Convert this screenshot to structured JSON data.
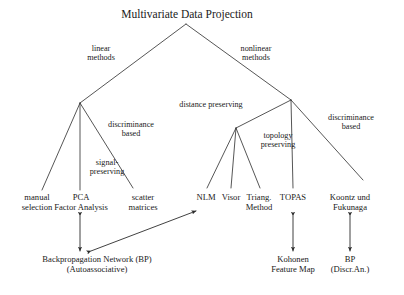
{
  "diagram": {
    "title": "Multivariate Data Projection",
    "title_x": 187,
    "branch_labels": [
      {
        "text": "linear\nmethods",
        "x": 101,
        "y": 44
      },
      {
        "text": "nonlinear\nmethods",
        "x": 256,
        "y": 44
      },
      {
        "text": "discriminance\nbased",
        "x": 131,
        "y": 120
      },
      {
        "text": "signal-\npreserving",
        "x": 107,
        "y": 158
      },
      {
        "text": "distance preserving",
        "x": 211,
        "y": 100
      },
      {
        "text": "topology\npreserving",
        "x": 278,
        "y": 131
      },
      {
        "text": "discriminance\nbased",
        "x": 351,
        "y": 113
      }
    ],
    "leaves": [
      {
        "text": "manual\nselection",
        "x": 37
      },
      {
        "text": "PCA\nFactor Analysis",
        "x": 81
      },
      {
        "text": "scatter\nmatrices",
        "x": 143
      },
      {
        "text": "NLM",
        "x": 206
      },
      {
        "text": "Visor",
        "x": 231
      },
      {
        "text": "Triang.\nMethod",
        "x": 259
      },
      {
        "text": "TOPAS",
        "x": 293
      },
      {
        "text": "Koontz und\nFukunaga",
        "x": 350
      }
    ],
    "terminals": [
      {
        "text": "Backpropagation Network (BP)\n(Autoassociative)",
        "x": 97
      },
      {
        "text": "Kohonen\nFeature Map",
        "x": 293
      },
      {
        "text": "BP\n(Discr.An.)",
        "x": 350
      }
    ],
    "edges": [
      {
        "name": "root-to-linear",
        "x1": 186,
        "y1": 24,
        "x2": 80,
        "y2": 103
      },
      {
        "name": "root-to-nonlinear",
        "x1": 186,
        "y1": 24,
        "x2": 291,
        "y2": 100
      },
      {
        "name": "linear-to-manual",
        "x1": 80,
        "y1": 103,
        "x2": 42,
        "y2": 190
      },
      {
        "name": "linear-to-pca",
        "x1": 80,
        "y1": 103,
        "x2": 80,
        "y2": 190
      },
      {
        "name": "linear-to-scatter",
        "x1": 80,
        "y1": 103,
        "x2": 133,
        "y2": 188
      },
      {
        "name": "nonlinear-to-distance",
        "x1": 291,
        "y1": 100,
        "x2": 236,
        "y2": 128
      },
      {
        "name": "nonlinear-to-topas",
        "x1": 291,
        "y1": 100,
        "x2": 293,
        "y2": 188
      },
      {
        "name": "nonlinear-to-koontz",
        "x1": 291,
        "y1": 100,
        "x2": 363,
        "y2": 180
      },
      {
        "name": "distance-to-nlm",
        "x1": 236,
        "y1": 128,
        "x2": 207,
        "y2": 188
      },
      {
        "name": "distance-to-visor",
        "x1": 236,
        "y1": 128,
        "x2": 231,
        "y2": 188
      },
      {
        "name": "distance-to-triang",
        "x1": 236,
        "y1": 128,
        "x2": 260,
        "y2": 188
      }
    ],
    "arrows": [
      {
        "name": "pca-bp-link",
        "x1": 80,
        "y1": 216,
        "x2": 80,
        "y2": 251
      },
      {
        "name": "bp-nlm-link",
        "x1": 91,
        "y1": 251,
        "x2": 196,
        "y2": 211
      },
      {
        "name": "topas-kohonen-link",
        "x1": 293,
        "y1": 216,
        "x2": 293,
        "y2": 251
      },
      {
        "name": "koontz-bp-link",
        "x1": 350,
        "y1": 216,
        "x2": 350,
        "y2": 251
      }
    ],
    "stroke_color": "#2b2b2b"
  }
}
